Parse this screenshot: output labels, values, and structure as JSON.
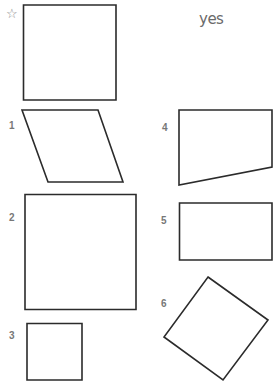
{
  "reference": {
    "marker_icon": "star-outline",
    "marker_glyph": "☆",
    "shape": "square"
  },
  "answer": {
    "text": "yes"
  },
  "options": [
    {
      "label": "1",
      "shape": "parallelogram"
    },
    {
      "label": "2",
      "shape": "square"
    },
    {
      "label": "3",
      "shape": "square"
    },
    {
      "label": "4",
      "shape": "trapezoid"
    },
    {
      "label": "5",
      "shape": "rectangle"
    },
    {
      "label": "6",
      "shape": "rotated-square"
    }
  ],
  "colors": {
    "stroke": "#2b2b2b",
    "label": "#777777",
    "answer": "#6a6a6a"
  }
}
